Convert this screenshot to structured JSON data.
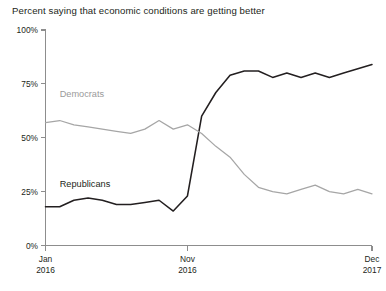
{
  "chart": {
    "title": "Percent saying that economic conditions are getting better"
  },
  "chart_data": {
    "type": "line",
    "title": "Percent saying that economic conditions are getting better",
    "xlabel": "",
    "ylabel": "",
    "ylim": [
      0,
      100
    ],
    "ytick_labels": [
      "0%",
      "25%",
      "50%",
      "75%",
      "100%"
    ],
    "ytick_values": [
      0,
      25,
      50,
      75,
      100
    ],
    "grid": false,
    "legend_position": "inline-labels",
    "x": [
      "Jan 2016",
      "Feb 2016",
      "Mar 2016",
      "Apr 2016",
      "May 2016",
      "Jun 2016",
      "Jul 2016",
      "Aug 2016",
      "Sep 2016",
      "Oct 2016",
      "Nov 2016",
      "Dec 2016",
      "Jan 2017",
      "Feb 2017",
      "Mar 2017",
      "Apr 2017",
      "May 2017",
      "Jun 2017",
      "Jul 2017",
      "Aug 2017",
      "Sep 2017",
      "Oct 2017",
      "Nov 2017",
      "Dec 2017"
    ],
    "xtick_labels": [
      {
        "line1": "Jan",
        "line2": "2016",
        "index": 0
      },
      {
        "line1": "Nov",
        "line2": "2016",
        "index": 10
      },
      {
        "line1": "Dec",
        "line2": "2017",
        "index": 23
      }
    ],
    "series": [
      {
        "name": "Republicans",
        "color": "#231f20",
        "label_x_index": 1,
        "label_value": 27,
        "values": [
          18,
          18,
          21,
          22,
          21,
          19,
          19,
          20,
          21,
          16,
          23,
          60,
          71,
          79,
          81,
          81,
          78,
          80,
          78,
          80,
          78,
          80,
          82,
          84
        ]
      },
      {
        "name": "Democrats",
        "color": "#a6a6a6",
        "label_x_index": 1,
        "label_value": 69,
        "values": [
          57,
          58,
          56,
          55,
          54,
          53,
          52,
          54,
          58,
          54,
          56,
          52,
          46,
          41,
          33,
          27,
          25,
          24,
          26,
          28,
          25,
          24,
          26,
          24
        ]
      }
    ]
  }
}
